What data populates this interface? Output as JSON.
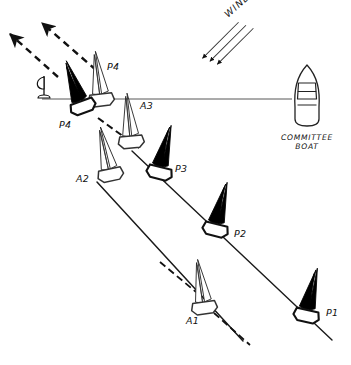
{
  "diagram": {
    "background_color": "#ffffff",
    "ink_color": "#111111",
    "dark_sail_color": "#000000",
    "light_sail_color": "#ffffff",
    "width": 351,
    "height": 365
  },
  "wind": {
    "label": "WIND",
    "direction": "from upper-right toward lower-left",
    "arrow_count": 3
  },
  "start_line": {
    "name": "starting line",
    "pin_end_label": "",
    "boat_end_label": "COMMITTEE BOAT"
  },
  "committee_boat": {
    "label_line_1": "COMMITTEE",
    "label_line_2": "BOAT",
    "icon": "motor-boat-top-view"
  },
  "pin_mark": {
    "icon": "pin-mark-buoy",
    "label": ""
  },
  "boats": [
    {
      "id": "P1",
      "label": "P1",
      "fleet": "port-tack",
      "sail": "dark",
      "x": 305,
      "y": 310
    },
    {
      "id": "P2",
      "label": "P2",
      "fleet": "port-tack",
      "sail": "dark",
      "x": 215,
      "y": 220
    },
    {
      "id": "P3",
      "label": "P3",
      "fleet": "port-tack",
      "sail": "dark",
      "x": 163,
      "y": 168
    },
    {
      "id": "P4",
      "label": "P4",
      "fleet": "port-tack",
      "sail": "dark",
      "x": 84,
      "y": 103
    },
    {
      "id": "A1",
      "label": "A1",
      "fleet": "starboard-tack",
      "sail": "light",
      "x": 203,
      "y": 303
    },
    {
      "id": "A2",
      "label": "A2",
      "fleet": "starboard-tack",
      "sail": "light",
      "x": 112,
      "y": 172
    },
    {
      "id": "A3",
      "label": "A3",
      "fleet": "starboard-tack",
      "sail": "light",
      "x": 136,
      "y": 127
    },
    {
      "id": "A4",
      "label": "A4",
      "fleet": "starboard-tack",
      "sail": "light",
      "x": 100,
      "y": 90
    }
  ],
  "tracks": {
    "port_track_label": "P-boat track",
    "starboard_track_label": "A-boat track"
  },
  "escape_arrows": {
    "count": 2,
    "style": "dashed",
    "direction": "toward upper-left"
  }
}
